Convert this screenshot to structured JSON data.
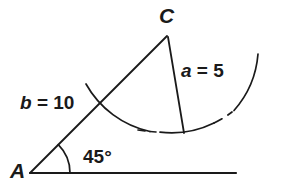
{
  "diagram": {
    "type": "triangle-ssa-ambiguous-case",
    "background_color": "#ffffff",
    "stroke_color": "#1a1a1a",
    "labels": {
      "vertex_a": "A",
      "vertex_c": "C",
      "side_b": "b = 10",
      "side_b_symbol": "b",
      "side_b_value": " = 10",
      "side_a": "a = 5",
      "side_a_symbol": "a",
      "side_a_value": " = 5",
      "angle_a": "45°"
    },
    "values": {
      "side_b_length": 10,
      "side_a_length": 5,
      "angle_a_degrees": 45
    },
    "geometry": {
      "point_a": [
        30,
        173
      ],
      "point_c": [
        167,
        35
      ],
      "baseline_end": [
        236,
        173
      ],
      "arc_foot_point": [
        184,
        132
      ],
      "angle_arc_radius": 40,
      "swing_arc_radius": 97
    }
  }
}
